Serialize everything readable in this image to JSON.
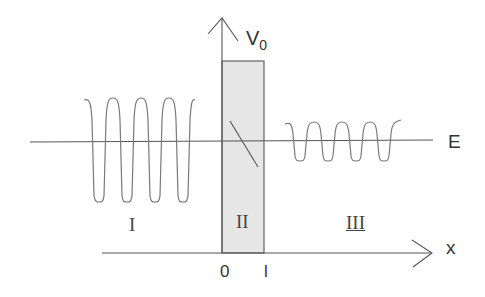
{
  "diagram": {
    "labels": {
      "potential": "V",
      "potential_sub": "0",
      "energy": "E",
      "x_axis": "x",
      "origin": "0",
      "barrier_width": "l"
    },
    "regions": [
      {
        "id": "I",
        "label": "I",
        "description": "incident + reflected wave, large amplitude"
      },
      {
        "id": "II",
        "label": "II",
        "description": "barrier, decaying wavefunction"
      },
      {
        "id": "III",
        "label": "III",
        "description": "transmitted wave, smaller amplitude"
      }
    ],
    "colors": {
      "barrier_fill": "#e6e6e6",
      "line": "#555555",
      "wave": "#7a7a7a",
      "text": "#333333"
    }
  }
}
